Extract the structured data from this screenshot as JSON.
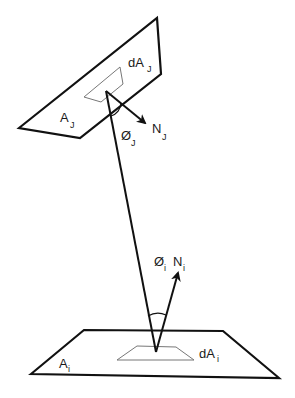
{
  "diagram": {
    "type": "radiative view factor geometry",
    "colors": {
      "stroke": "#111111",
      "thin_stroke": "#666666",
      "background": "#ffffff"
    },
    "surfaces": [
      {
        "id": "surface-j",
        "label": "A",
        "subscript": "J",
        "element_label": "dA",
        "element_subscript": "J"
      },
      {
        "id": "surface-i",
        "label": "A",
        "subscript": "i",
        "element_label": "dA",
        "element_subscript": "i"
      }
    ],
    "normals": [
      {
        "id": "normal-j",
        "label": "N",
        "subscript": "J"
      },
      {
        "id": "normal-i",
        "label": "N",
        "subscript": "i"
      }
    ],
    "angles": [
      {
        "id": "angle-j",
        "label": "Ø",
        "subscript": "J"
      },
      {
        "id": "angle-i",
        "label": "Ø",
        "subscript": "i"
      }
    ]
  }
}
